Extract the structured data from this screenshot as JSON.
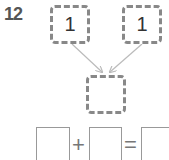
{
  "problem": {
    "number": "12",
    "top_left_value": "1",
    "top_right_value": "1",
    "result_value": "",
    "equation": {
      "left": "",
      "operator": "+",
      "right": "",
      "equals": "=",
      "result": ""
    }
  }
}
